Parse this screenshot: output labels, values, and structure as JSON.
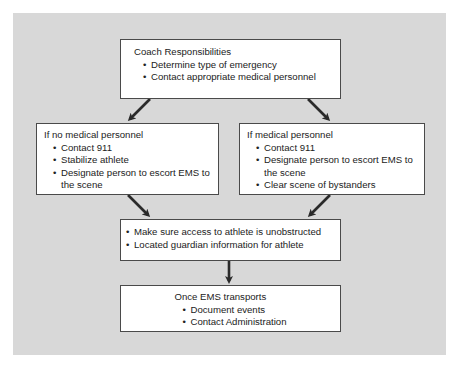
{
  "diagram": {
    "type": "flowchart",
    "colors": {
      "background_panel": "#d8d8d8",
      "box_fill": "#ffffff",
      "box_border": "#4a4a4a",
      "arrow": "#2a2a2a",
      "text": "#222222"
    },
    "nodes": {
      "coach": {
        "title": "Coach Responsibilities",
        "items": [
          "Determine type of emergency",
          "Contact appropriate medical personnel"
        ]
      },
      "no_medical": {
        "title": "If no medical personnel",
        "items": [
          "Contact 911",
          "Stabilize athlete",
          "Designate person to escort EMS to the scene"
        ]
      },
      "medical": {
        "title": "If medical personnel",
        "items": [
          "Contact 911",
          "Designate person to escort EMS to the scene",
          "Clear scene of bystanders"
        ]
      },
      "access": {
        "items": [
          "Make sure access to athlete is unobstructed",
          "Located guardian information for athlete"
        ]
      },
      "transport": {
        "title": "Once EMS transports",
        "items": [
          "Document events",
          "Contact Administration"
        ]
      }
    },
    "edges": [
      {
        "from": "coach",
        "to": "no_medical"
      },
      {
        "from": "coach",
        "to": "medical"
      },
      {
        "from": "no_medical",
        "to": "access"
      },
      {
        "from": "medical",
        "to": "access"
      },
      {
        "from": "access",
        "to": "transport"
      }
    ]
  }
}
